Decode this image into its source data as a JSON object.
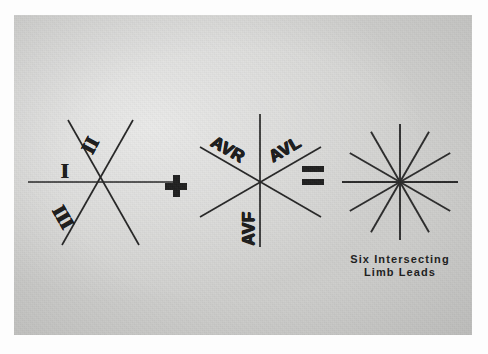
{
  "figure": {
    "kind": "ecg-limb-lead-vector-diagram",
    "background_color": "#d3d3d1",
    "ink_color": "#262626",
    "border_color": "#ffffff"
  },
  "equation": {
    "plus_symbol": "+",
    "equals_symbol": "="
  },
  "bipolar_diagram": {
    "name": "bipolar-limb-leads",
    "center": {
      "x": 95,
      "y": 182
    },
    "labels": [
      {
        "id": "lead-i",
        "text": "I",
        "rotation_deg": 0,
        "x": 55,
        "y": 163
      },
      {
        "id": "lead-ii",
        "text": "II",
        "rotation_deg": -62,
        "x": 85,
        "y": 138
      },
      {
        "id": "lead-iii",
        "text": "III",
        "rotation_deg": 60,
        "x": 60,
        "y": 208
      }
    ],
    "lines": [
      {
        "id": "axis-lead-i",
        "angle_deg": 0
      },
      {
        "id": "axis-lead-ii",
        "angle_deg": 60
      },
      {
        "id": "axis-lead-iii",
        "angle_deg": -60
      }
    ]
  },
  "augmented_diagram": {
    "name": "augmented-limb-leads",
    "center": {
      "x": 245,
      "y": 180
    },
    "labels": [
      {
        "id": "lead-avr",
        "text": "AVR",
        "rotation_deg": 30,
        "x": 216,
        "y": 147
      },
      {
        "id": "lead-avl",
        "text": "AVL",
        "rotation_deg": -30,
        "x": 276,
        "y": 147
      },
      {
        "id": "lead-avf",
        "text": "AVF",
        "rotation_deg": -90,
        "x": 235,
        "y": 214
      }
    ],
    "lines": [
      {
        "id": "axis-lead-avf",
        "angle_deg": 90
      },
      {
        "id": "axis-lead-avr",
        "angle_deg": 30
      },
      {
        "id": "axis-lead-avl",
        "angle_deg": -30
      }
    ]
  },
  "combined_diagram": {
    "name": "six-intersecting-limb-leads",
    "center": {
      "x": 400,
      "y": 182
    },
    "radius": 58,
    "line_count": 6,
    "ray_count": 12,
    "angles_deg": [
      0,
      30,
      60,
      90,
      120,
      150
    ],
    "caption_line_1": "Six Intersecting",
    "caption_line_2": "Limb Leads"
  }
}
